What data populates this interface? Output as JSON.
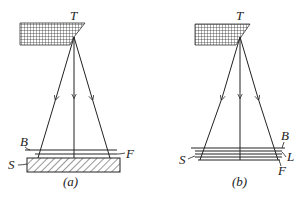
{
  "figure": {
    "panels": [
      {
        "id": "a",
        "caption": "(a)",
        "labels": {
          "target": "T",
          "layer_b": "B",
          "layer_f": "F",
          "substrate": "S"
        }
      },
      {
        "id": "b",
        "caption": "(b)",
        "labels": {
          "target": "T",
          "layer_b": "B",
          "layer_l": "L",
          "layer_s": "S",
          "layer_f": "F"
        }
      }
    ],
    "colors": {
      "ink": "#222222",
      "background": "#ffffff"
    }
  }
}
